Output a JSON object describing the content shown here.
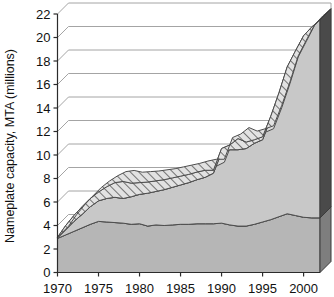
{
  "chart_data": {
    "type": "area",
    "title": "",
    "xlabel": "",
    "ylabel": "Nameplate capacity, MTA (millions)",
    "xlim": [
      1970,
      2002
    ],
    "ylim": [
      0,
      22
    ],
    "grid": true,
    "legend": "none",
    "style": "3d-stacked-area",
    "x_tick_labels": [
      "1970",
      "1975",
      "1980",
      "1985",
      "1990",
      "1995",
      "2000"
    ],
    "x_ticks": [
      1970,
      1975,
      1980,
      1985,
      1990,
      1995,
      2000
    ],
    "y_tick_labels": [
      "0",
      "2",
      "4",
      "6",
      "8",
      "10",
      "12",
      "14",
      "16",
      "18",
      "20",
      "22"
    ],
    "y_ticks": [
      0,
      2,
      4,
      6,
      8,
      10,
      12,
      14,
      16,
      18,
      20,
      22
    ],
    "x": [
      1970,
      1971,
      1972,
      1973,
      1974,
      1975,
      1976,
      1977,
      1978,
      1979,
      1980,
      1981,
      1982,
      1983,
      1984,
      1985,
      1986,
      1987,
      1988,
      1989,
      1990,
      1991,
      1992,
      1993,
      1994,
      1995,
      1996,
      1997,
      1998,
      1999,
      2000,
      2001,
      2002
    ],
    "series": [
      {
        "name": "lower-band",
        "fill_color": "#b6b6b6",
        "pattern": "solid",
        "values": [
          2.9,
          3.2,
          3.5,
          3.8,
          4.1,
          4.35,
          4.3,
          4.25,
          4.2,
          4.1,
          4.15,
          3.95,
          4.05,
          4.0,
          4.05,
          4.1,
          4.1,
          4.15,
          4.15,
          4.15,
          4.2,
          4.05,
          3.95,
          3.95,
          4.1,
          4.3,
          4.5,
          4.75,
          5.0,
          4.85,
          4.7,
          4.65,
          4.65
        ]
      },
      {
        "name": "middle-band",
        "fill_color": "#c8c8c8",
        "pattern": "solid",
        "values": [
          0.05,
          0.45,
          0.85,
          1.15,
          1.5,
          1.75,
          2.0,
          2.15,
          2.1,
          2.35,
          2.5,
          2.8,
          2.85,
          3.05,
          3.2,
          3.35,
          3.55,
          3.75,
          3.95,
          4.3,
          6.0,
          6.4,
          6.5,
          6.6,
          6.9,
          7.0,
          8.6,
          10.4,
          12.4,
          13.9,
          15.4,
          16.2,
          16.85
        ]
      },
      {
        "name": "upper-hatched-band",
        "fill_color": "#d9d9d9",
        "pattern": "diagonal-hatch",
        "values": [
          0.05,
          0.35,
          0.5,
          0.65,
          0.7,
          0.75,
          1.0,
          1.25,
          1.45,
          1.15,
          1.0,
          0.95,
          0.9,
          0.85,
          0.8,
          0.75,
          0.7,
          0.65,
          0.6,
          0.25,
          0.35,
          0.4,
          0.95,
          0.55,
          0.3,
          0.25,
          0.2,
          0.15,
          0.1,
          0.1,
          0.05,
          0.05,
          0.0
        ]
      }
    ],
    "stacked_totals": [
      3.0,
      4.0,
      4.85,
      5.6,
      6.3,
      6.85,
      7.3,
      7.65,
      7.75,
      7.6,
      7.65,
      7.7,
      7.8,
      7.9,
      8.05,
      8.2,
      8.35,
      8.55,
      8.7,
      8.7,
      10.55,
      10.85,
      11.4,
      11.1,
      11.3,
      11.55,
      13.3,
      15.3,
      17.5,
      18.85,
      20.15,
      20.9,
      21.5
    ],
    "depth_offset": {
      "x": 11,
      "y": -11
    }
  }
}
